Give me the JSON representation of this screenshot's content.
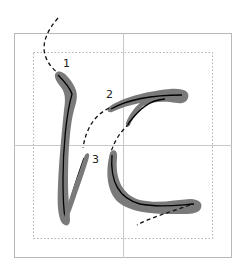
{
  "diagram": {
    "stroke_labels": [
      {
        "id": 1,
        "label": "1"
      },
      {
        "id": 2,
        "label": "2"
      },
      {
        "id": 3,
        "label": "3"
      }
    ],
    "colors": {
      "grid_border": "#b8b8b8",
      "grid_dotted": "#b0b0b0",
      "stroke_fill": "#7a7a7a",
      "stroke_center": "#000000",
      "guide_dash": "#111111",
      "background": "#ffffff"
    }
  }
}
